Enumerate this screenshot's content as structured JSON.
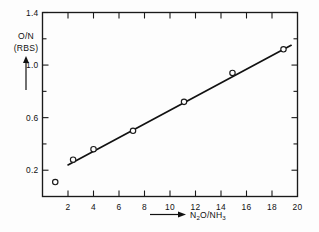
{
  "chart_data": {
    "type": "scatter",
    "title": "",
    "subtitle": "",
    "xlabel": "N2O/NH3",
    "xlabel_parts": [
      {
        "text": "N",
        "sub": false
      },
      {
        "text": "2",
        "sub": true
      },
      {
        "text": "O/NH",
        "sub": false
      },
      {
        "text": "3",
        "sub": true
      }
    ],
    "ylabel": "O/N (RBS)",
    "ylabel_line1": "O/N",
    "ylabel_line2": "(RBS)",
    "xlim": [
      0,
      20
    ],
    "ylim": [
      0,
      1.4
    ],
    "x_ticks": [
      0,
      2,
      4,
      6,
      8,
      10,
      12,
      14,
      16,
      18,
      20
    ],
    "x_tick_labels": [
      "",
      "2",
      "4",
      "6",
      "8",
      "10",
      "12",
      "14",
      "16",
      "18",
      "20"
    ],
    "y_ticks": [
      0,
      0.2,
      0.4,
      0.6,
      0.8,
      1.0,
      1.2,
      1.4
    ],
    "y_tick_labels": [
      "",
      "0.2",
      "",
      "0.6",
      "",
      "1.0",
      "",
      "1.4"
    ],
    "grid": false,
    "legend": "none",
    "frame": "box",
    "tick_direction": "in",
    "series": [
      {
        "name": "O/N vs N2O/NH3",
        "marker": "open-circle",
        "points": [
          {
            "x": 1.0,
            "y": 0.11
          },
          {
            "x": 2.4,
            "y": 0.28
          },
          {
            "x": 4.0,
            "y": 0.36
          },
          {
            "x": 7.1,
            "y": 0.5
          },
          {
            "x": 11.1,
            "y": 0.72
          },
          {
            "x": 14.9,
            "y": 0.94
          },
          {
            "x": 18.9,
            "y": 1.12
          }
        ]
      },
      {
        "name": "linear fit",
        "type": "line",
        "x_start": 2.0,
        "y_start": 0.24,
        "x_end": 19.5,
        "y_end": 1.15
      }
    ],
    "annotations": [
      {
        "text": "x-axis arrow",
        "kind": "arrow",
        "direction": "right"
      },
      {
        "text": "y-axis arrow",
        "kind": "arrow",
        "direction": "up"
      }
    ]
  }
}
